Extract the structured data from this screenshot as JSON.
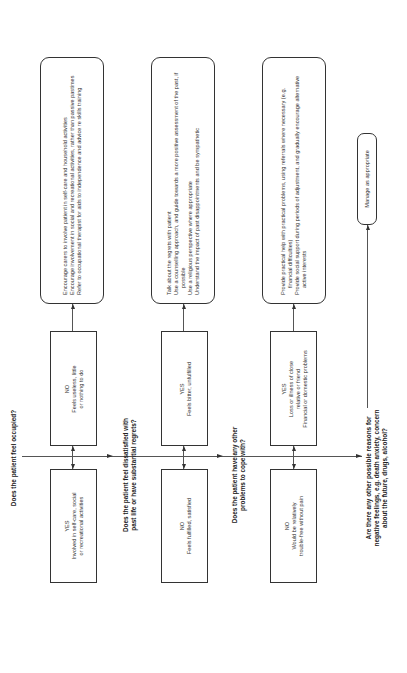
{
  "questions": [
    "Does the patient feel occupied?",
    "Does the patient feel dissatisfied with past life or have substantial regrets?",
    "Does the patient have any other problems to cope with?",
    "Are there any other possible reasons for negative feelings, e.g. death anxiety, concern about the future, drugs, alcohol?"
  ],
  "question_lines": [
    [
      "Does the patient feel occupied?"
    ],
    [
      "Does the patient feel dissatisfied with",
      "past life or have substantial regrets?"
    ],
    [
      "Does the patient have any other",
      "problems to cope with?"
    ],
    [
      "Are there any other possible reasons for",
      "negative feelings, e.g. death anxiety, concern",
      "about the future, drugs, alcohol?"
    ]
  ],
  "steps": [
    {
      "upper": {
        "label": "NO",
        "lines": [
          "Feels useless, little",
          "or nothing to do"
        ]
      },
      "lower": {
        "label": "YES",
        "lines": [
          "Involved in self-care, social",
          "or recreational activities"
        ]
      },
      "actions": [
        "Encourage carers to involve patient in self-care and household activities",
        "Encourage involvement in social and recreational activities, rather than passive pastimes",
        "Refer to occupational therapist for aids to independence and advice re skills training"
      ]
    },
    {
      "upper": {
        "label": "YES",
        "lines": [
          "Feels bitter, unfulfilled"
        ]
      },
      "lower": {
        "label": "NO",
        "lines": [
          "Feels fulfilled, satisfied"
        ]
      },
      "actions": [
        "Talk about the regrets with patient",
        "Use a counselling approach, and guide towards a more positive assessment of the past, if possible",
        "Use a religious perspective where appropriate",
        "Understand the impact of past disappointments and be sympathetic"
      ]
    },
    {
      "upper": {
        "label": "YES",
        "lines": [
          "Loss or illness of close",
          "relative or friend",
          "Financial or domestic problems"
        ]
      },
      "lower": {
        "label": "NO",
        "lines": [
          "Would be relatively",
          "trouble-free without pain"
        ]
      },
      "actions": [
        "Provide practical help with practical problems, using referrals where necessary (e.g. financial difficulties)",
        "Provide social support during periods of adjustment, and gradually encourage alternative active interests"
      ]
    }
  ],
  "final_action": "Manage as appropriate",
  "colors": {
    "line": "#555555",
    "border": "#333333",
    "text": "#222222",
    "background": "#ffffff"
  }
}
